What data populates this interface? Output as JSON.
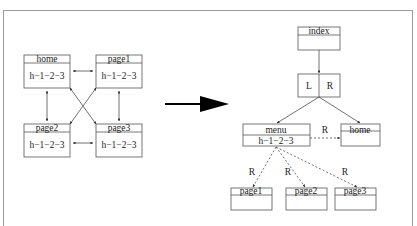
{
  "left_graph": {
    "nodes": [
      {
        "id": "home",
        "title": "home",
        "body": "h−1−2−3"
      },
      {
        "id": "page1",
        "title": "page1",
        "body": "h−1−2−3"
      },
      {
        "id": "page2",
        "title": "page2",
        "body": "h−1−2−3"
      },
      {
        "id": "page3",
        "title": "page3",
        "body": "h−1−2−3"
      }
    ],
    "edges": [
      "home<->page1",
      "home<->page2",
      "page1<->page3",
      "page2<->page3",
      "home<->page3",
      "page1<->page2"
    ]
  },
  "transform_arrow": "right-arrow",
  "right_tree": {
    "root": {
      "title": "index"
    },
    "split": {
      "left": "L",
      "right": "R"
    },
    "menu": {
      "title": "menu",
      "body": "h−1−2−3"
    },
    "home": {
      "title": "home"
    },
    "menu_home_label": "R",
    "leaves": [
      {
        "title": "page1",
        "edge_label": "R"
      },
      {
        "title": "page2",
        "edge_label": "R"
      },
      {
        "title": "page3",
        "edge_label": "R"
      }
    ]
  }
}
